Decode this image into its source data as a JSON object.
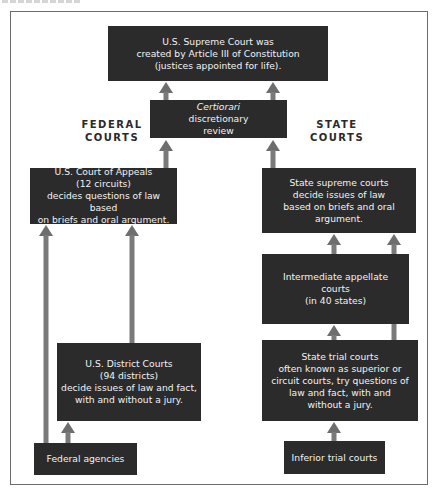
{
  "diagram": {
    "sections": {
      "federal_label": [
        "FEDERAL",
        "COURTS"
      ],
      "state_label": [
        "STATE",
        "COURTS"
      ]
    },
    "nodes": {
      "supreme_court": [
        "U.S. Supreme Court was",
        "created by Article III of Constitution",
        "(justices appointed for life)."
      ],
      "certiorari": [
        "Certiorari",
        "discretionary",
        "review"
      ],
      "court_of_appeals": [
        "U.S. Court of Appeals",
        "(12 circuits)",
        "decides questions of law based",
        "on briefs and oral argument."
      ],
      "district_courts": [
        "U.S. District Courts",
        "(94 districts)",
        "decide issues of law and fact,",
        "with and without a jury."
      ],
      "federal_agencies": [
        "Federal agencies"
      ],
      "state_supreme": [
        "State supreme courts",
        "decide issues of law",
        "based on briefs and oral",
        "argument."
      ],
      "intermediate_appellate": [
        "Intermediate appellate",
        "courts",
        "(in 40 states)"
      ],
      "state_trial": [
        "State trial courts",
        "often known as superior or",
        "circuit courts, try questions of",
        "law and fact, with and",
        "without a jury."
      ],
      "inferior_trial": [
        "Inferior trial courts"
      ]
    },
    "edges": [
      {
        "from": "certiorari",
        "to": "supreme_court"
      },
      {
        "from": "court_of_appeals",
        "to": "certiorari"
      },
      {
        "from": "state_supreme",
        "to": "certiorari"
      },
      {
        "from": "district_courts",
        "to": "court_of_appeals"
      },
      {
        "from": "federal_agencies",
        "to": "court_of_appeals"
      },
      {
        "from": "federal_agencies",
        "to": "district_courts"
      },
      {
        "from": "intermediate_appellate",
        "to": "state_supreme"
      },
      {
        "from": "state_trial",
        "to": "intermediate_appellate"
      },
      {
        "from": "state_trial",
        "to": "state_supreme"
      },
      {
        "from": "inferior_trial",
        "to": "state_trial"
      }
    ],
    "colors": {
      "box": "#2b2b2b",
      "box_text": "#f2f2f2",
      "arrow": "#7a7a7a",
      "frame": "#6b6b6b"
    }
  }
}
